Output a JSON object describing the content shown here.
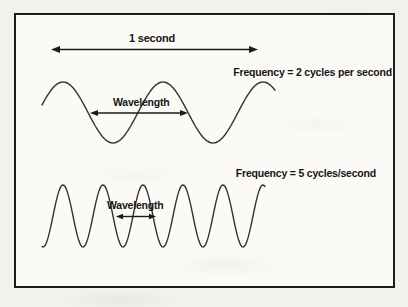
{
  "diagram": {
    "title_implicit": "Frequency and wavelength of waves",
    "ink_color": "#1b1b1b",
    "wave_stroke_color": "#333330",
    "paper_color": "#f2f1ed",
    "panel_color": "#fbfaf7",
    "time_label": "1 second",
    "waves": [
      {
        "name": "wave-2hz",
        "frequency_label": "Frequency = 2 cycles per second",
        "wavelength_label": "Wavelength",
        "cycles_per_second": 2,
        "geometry": {
          "x_start": 42,
          "x_end": 275,
          "mid_y": 112.5,
          "amplitude": 30.5,
          "wavelength_px": 100,
          "peak_x": 63,
          "stroke_w": 1.4
        }
      },
      {
        "name": "wave-5hz",
        "frequency_label": "Frequency = 5 cycles/second",
        "wavelength_label": "Wavelength",
        "cycles_per_second": 5,
        "geometry": {
          "x_start": 42,
          "x_end": 265,
          "mid_y": 216,
          "amplitude": 31,
          "wavelength_px": 40,
          "peak_x": 63,
          "stroke_w": 1.4
        }
      }
    ],
    "arrows": [
      {
        "name": "one-second-span-arrow",
        "x1": 51,
        "x2": 258,
        "y": 49.5,
        "head_len": 9,
        "head_w": 7,
        "stroke_w": 1.6
      },
      {
        "name": "wavelength-arrow-2hz",
        "x1": 90,
        "x2": 188,
        "y": 113,
        "head_len": 8,
        "head_w": 6,
        "stroke_w": 1.4
      },
      {
        "name": "wavelength-arrow-5hz",
        "x1": 116,
        "x2": 156,
        "y": 216.5,
        "head_len": 7,
        "head_w": 5.5,
        "stroke_w": 1.4
      }
    ]
  }
}
